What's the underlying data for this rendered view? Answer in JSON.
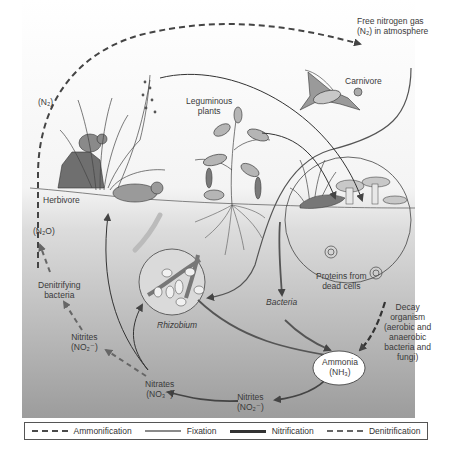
{
  "diagram": {
    "labels": {
      "free_nitrogen_line1": "Free nitrogen gas",
      "free_nitrogen_line2": "(N₂) in atmosphere",
      "carnivore": "Carnivore",
      "leguminous_line1": "Leguminous",
      "leguminous_line2": "plants",
      "n2": "(N₂)",
      "herbivore": "Herbivore",
      "n2o": "(N₂O)",
      "denitrifying_line1": "Denitrifying",
      "denitrifying_line2": "bacteria",
      "nitrites_left_line1": "Nitrites",
      "nitrites_left_line2": "(NO₂⁻)",
      "rhizobium": "Rhizobium",
      "bacteria": "Bacteria",
      "proteins_line1": "Proteins from",
      "proteins_line2": "dead cells",
      "decay_line1": "Decay",
      "decay_line2": "organism",
      "decay_line3": "(aerobic and",
      "decay_line4": "anaerobic",
      "decay_line5": "bacteria and",
      "decay_line6": "fungi)",
      "ammonia_line1": "Ammonia",
      "ammonia_line2": "(NH₃)",
      "nitrates_line1": "Nitrates",
      "nitrates_line2": "(NO₃⁻)",
      "nitrites_bottom_line1": "Nitrites",
      "nitrites_bottom_line2": "(NO₂⁻)"
    },
    "legend": [
      {
        "label": "Ammonification",
        "style": "dashed-bold",
        "color": "#4a4a4a"
      },
      {
        "label": "Fixation",
        "style": "solid-light",
        "color": "#8a8a8a"
      },
      {
        "label": "Nitrification",
        "style": "solid-bold",
        "color": "#333333"
      },
      {
        "label": "Denitrification",
        "style": "dashed-light",
        "color": "#666666"
      }
    ],
    "colors": {
      "background_top": "#ffffff",
      "background_bottom": "#9a9a9a",
      "line_dark": "#333333",
      "line_mid": "#666666"
    }
  }
}
